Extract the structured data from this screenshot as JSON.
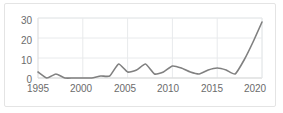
{
  "chart_data": {
    "type": "line",
    "title": "",
    "subtitle": "",
    "xlabel": "",
    "ylabel": "",
    "xlim": [
      1995,
      2020
    ],
    "ylim": [
      0,
      30
    ],
    "grid": true,
    "legend": null,
    "legend_position": "none",
    "line_color": "#808080",
    "x_tick_labels": [
      "1995",
      "2000",
      "2005",
      "2010",
      "2015",
      "2020"
    ],
    "x_ticks": [
      1995,
      2000,
      2005,
      2010,
      2015,
      2020
    ],
    "y_tick_labels": [
      "0",
      "10",
      "20",
      "30"
    ],
    "y_ticks": [
      0,
      10,
      20,
      30
    ],
    "series": [
      {
        "name": "series-1",
        "x": [
          1995,
          1996,
          1997,
          1998,
          1999,
          2000,
          2001,
          2002,
          2003,
          2004,
          2005,
          2006,
          2007,
          2008,
          2009,
          2010,
          2011,
          2012,
          2013,
          2014,
          2015,
          2016,
          2017,
          2018,
          2019,
          2020
        ],
        "values": [
          3,
          0,
          2,
          0,
          0,
          0,
          0,
          1,
          1,
          7,
          3,
          4,
          7,
          2,
          3,
          6,
          5,
          3,
          2,
          4,
          5,
          4,
          2,
          9,
          18,
          28
        ]
      }
    ]
  }
}
